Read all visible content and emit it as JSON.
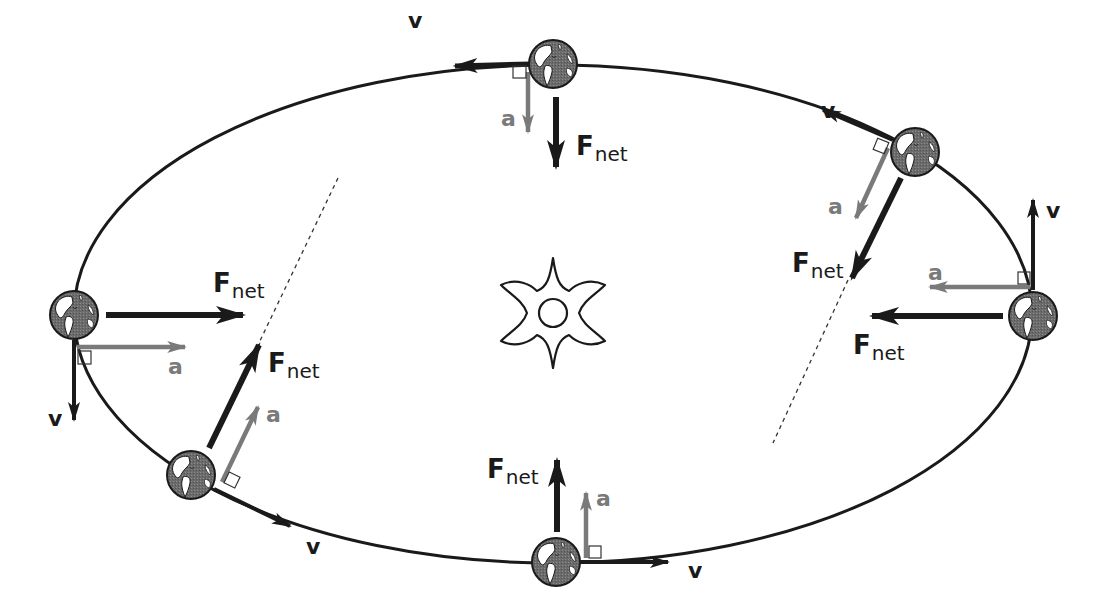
{
  "diagram": {
    "colors": {
      "orbit": "#1a1a1a",
      "velocity_arrow": "#1a1a1a",
      "force_arrow": "#1a1a1a",
      "acceleration_arrow": "#7a7a7a",
      "planet_fill": "#6e6e6e",
      "background": "#ffffff"
    },
    "labels": {
      "velocity": "v",
      "acceleration": "a",
      "force_main": "F",
      "force_sub": "net"
    },
    "central_body": {
      "name": "sun",
      "icon": "sun-icon"
    },
    "positions": [
      {
        "id": "top",
        "velocity_direction": "left",
        "force_direction": "down",
        "acceleration_direction": "down",
        "right_angle_marker": true
      },
      {
        "id": "upper-right",
        "velocity_direction": "up-left",
        "force_direction": "down-left",
        "acceleration_direction": "down-left",
        "right_angle_marker": true
      },
      {
        "id": "right",
        "velocity_direction": "up",
        "force_direction": "left",
        "acceleration_direction": "left",
        "right_angle_marker": true
      },
      {
        "id": "bottom",
        "velocity_direction": "right",
        "force_direction": "up",
        "acceleration_direction": "up",
        "right_angle_marker": true
      },
      {
        "id": "lower-left",
        "velocity_direction": "down-right",
        "force_direction": "up-right",
        "acceleration_direction": "up-right",
        "right_angle_marker": true
      },
      {
        "id": "left",
        "velocity_direction": "down",
        "force_direction": "right",
        "acceleration_direction": "right",
        "right_angle_marker": true
      }
    ],
    "guide_lines": [
      {
        "id": "left-dashed-line",
        "style": "dashed"
      },
      {
        "id": "right-dashed-line",
        "style": "dashed"
      }
    ]
  }
}
